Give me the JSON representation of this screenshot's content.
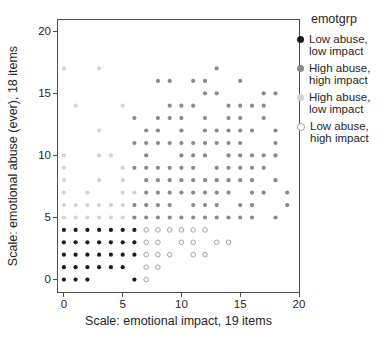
{
  "figure": {
    "background": "#ffffff",
    "frame_color": "#4d4d4d",
    "text_color": "#262626"
  },
  "chart_data": {
    "type": "scatter",
    "title": "",
    "xlabel": "Scale: emotional impact, 19 items",
    "ylabel": "Scale: emotional abuse (ever), 18 items",
    "xlim": [
      -0.5,
      20
    ],
    "ylim": [
      -1,
      20.9
    ],
    "xticks": [
      0,
      5,
      10,
      15,
      20
    ],
    "yticks": [
      0,
      5,
      10,
      15,
      20
    ],
    "grid": false,
    "legend_position": "right",
    "legend_title": "emotgrp",
    "series": [
      {
        "name": "Low abuse, low impact",
        "legend_lines": [
          "Low abuse,",
          "low impact"
        ],
        "marker": "filled",
        "color": "#1c1c1c",
        "points": [
          [
            0,
            0
          ],
          [
            1,
            0
          ],
          [
            2,
            0
          ],
          [
            6,
            0
          ],
          [
            0,
            1
          ],
          [
            1,
            1
          ],
          [
            2,
            1
          ],
          [
            3,
            1
          ],
          [
            4,
            1
          ],
          [
            5,
            1
          ],
          [
            0,
            2
          ],
          [
            1,
            2
          ],
          [
            2,
            2
          ],
          [
            3,
            2
          ],
          [
            4,
            2
          ],
          [
            5,
            2
          ],
          [
            6,
            2
          ],
          [
            0,
            3
          ],
          [
            1,
            3
          ],
          [
            2,
            3
          ],
          [
            3,
            3
          ],
          [
            4,
            3
          ],
          [
            5,
            3
          ],
          [
            6,
            3
          ],
          [
            0,
            4
          ],
          [
            1,
            4
          ],
          [
            2,
            4
          ],
          [
            3,
            4
          ],
          [
            4,
            4
          ],
          [
            5,
            4
          ],
          [
            6,
            4
          ]
        ]
      },
      {
        "name": "High abuse, high impact",
        "legend_lines": [
          "High abuse,",
          "high impact"
        ],
        "marker": "filled",
        "color": "#8a8a8a",
        "points": [
          [
            6,
            5
          ],
          [
            7,
            5
          ],
          [
            8,
            5
          ],
          [
            9,
            5
          ],
          [
            10,
            5
          ],
          [
            11,
            5
          ],
          [
            12,
            5
          ],
          [
            13,
            5
          ],
          [
            14,
            5
          ],
          [
            15,
            5
          ],
          [
            16,
            5
          ],
          [
            18,
            5
          ],
          [
            6,
            6
          ],
          [
            7,
            6
          ],
          [
            8,
            6
          ],
          [
            9,
            6
          ],
          [
            11,
            6
          ],
          [
            12,
            6
          ],
          [
            13,
            6
          ],
          [
            15,
            6
          ],
          [
            16,
            6
          ],
          [
            19,
            6
          ],
          [
            7,
            7
          ],
          [
            8,
            7
          ],
          [
            9,
            7
          ],
          [
            10,
            7
          ],
          [
            11,
            7
          ],
          [
            12,
            7
          ],
          [
            13,
            7
          ],
          [
            14,
            7
          ],
          [
            16,
            7
          ],
          [
            17,
            7
          ],
          [
            19,
            7
          ],
          [
            7,
            8
          ],
          [
            8,
            8
          ],
          [
            9,
            8
          ],
          [
            10,
            8
          ],
          [
            11,
            8
          ],
          [
            12,
            8
          ],
          [
            13,
            8
          ],
          [
            14,
            8
          ],
          [
            15,
            8
          ],
          [
            16,
            8
          ],
          [
            18,
            8
          ],
          [
            6,
            9
          ],
          [
            7,
            9
          ],
          [
            8,
            9
          ],
          [
            9,
            9
          ],
          [
            10,
            9
          ],
          [
            11,
            9
          ],
          [
            13,
            9
          ],
          [
            14,
            9
          ],
          [
            15,
            9
          ],
          [
            16,
            9
          ],
          [
            17,
            9
          ],
          [
            7,
            10
          ],
          [
            10,
            10
          ],
          [
            11,
            10
          ],
          [
            12,
            10
          ],
          [
            14,
            10
          ],
          [
            15,
            10
          ],
          [
            16,
            10
          ],
          [
            17,
            10
          ],
          [
            18,
            10
          ],
          [
            6,
            11
          ],
          [
            7,
            11
          ],
          [
            8,
            11
          ],
          [
            9,
            11
          ],
          [
            10,
            11
          ],
          [
            11,
            11
          ],
          [
            12,
            11
          ],
          [
            13,
            11
          ],
          [
            14,
            11
          ],
          [
            15,
            11
          ],
          [
            18,
            11
          ],
          [
            7,
            12
          ],
          [
            8,
            12
          ],
          [
            10,
            12
          ],
          [
            12,
            12
          ],
          [
            13,
            12
          ],
          [
            14,
            12
          ],
          [
            15,
            12
          ],
          [
            16,
            12
          ],
          [
            18,
            12
          ],
          [
            6,
            13
          ],
          [
            8,
            13
          ],
          [
            9,
            13
          ],
          [
            10,
            13
          ],
          [
            12,
            13
          ],
          [
            14,
            13
          ],
          [
            15,
            13
          ],
          [
            17,
            13
          ],
          [
            9,
            14
          ],
          [
            10,
            14
          ],
          [
            11,
            14
          ],
          [
            14,
            14
          ],
          [
            15,
            14
          ],
          [
            16,
            14
          ],
          [
            17,
            14
          ],
          [
            12,
            15
          ],
          [
            13,
            15
          ],
          [
            17,
            15
          ],
          [
            18,
            15
          ],
          [
            8,
            16
          ],
          [
            9,
            16
          ],
          [
            11,
            16
          ],
          [
            12,
            16
          ],
          [
            15,
            16
          ],
          [
            13,
            17
          ]
        ]
      },
      {
        "name": "High abuse, low impact",
        "legend_lines": [
          "High abuse,",
          "low impact"
        ],
        "marker": "filled",
        "color": "#d3d3d3",
        "points": [
          [
            0,
            5
          ],
          [
            1,
            5
          ],
          [
            2,
            5
          ],
          [
            3,
            5
          ],
          [
            4,
            5
          ],
          [
            5,
            5
          ],
          [
            0,
            6
          ],
          [
            1,
            6
          ],
          [
            2,
            6
          ],
          [
            3,
            6
          ],
          [
            4,
            6
          ],
          [
            5,
            6
          ],
          [
            0,
            7
          ],
          [
            2,
            7
          ],
          [
            5,
            7
          ],
          [
            6,
            7
          ],
          [
            0,
            8
          ],
          [
            3,
            8
          ],
          [
            5,
            8
          ],
          [
            0,
            9
          ],
          [
            5,
            9
          ],
          [
            0,
            10
          ],
          [
            3,
            10
          ],
          [
            4,
            10
          ],
          [
            3,
            12
          ],
          [
            1,
            14
          ],
          [
            5,
            14
          ],
          [
            0,
            17
          ],
          [
            3,
            17
          ]
        ]
      },
      {
        "name": "Low abuse, high impact",
        "legend_lines": [
          "Low abuse,",
          "high impact"
        ],
        "marker": "open",
        "color": "#a3a3a3",
        "points": [
          [
            7,
            0
          ],
          [
            7,
            1
          ],
          [
            8,
            1
          ],
          [
            7,
            2
          ],
          [
            8,
            2
          ],
          [
            9,
            2
          ],
          [
            11,
            2
          ],
          [
            12,
            2
          ],
          [
            7,
            3
          ],
          [
            8,
            3
          ],
          [
            10,
            3
          ],
          [
            11,
            3
          ],
          [
            13,
            3
          ],
          [
            14,
            3
          ],
          [
            7,
            4
          ],
          [
            8,
            4
          ],
          [
            9,
            4
          ],
          [
            10,
            4
          ],
          [
            11,
            4
          ],
          [
            12,
            4
          ]
        ]
      }
    ]
  }
}
